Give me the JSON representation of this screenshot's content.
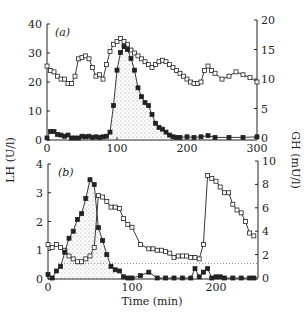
{
  "chart_data": [
    {
      "type": "line",
      "panel_label": "(a)",
      "x_ticks": [
        0,
        100,
        200,
        300
      ],
      "xlim": [
        0,
        300
      ],
      "left_axis": {
        "label": "LH (U/l)",
        "ticks": [
          0,
          10,
          20,
          30,
          40
        ],
        "lim": [
          0,
          40
        ]
      },
      "right_axis": {
        "label": "GH (mU/l)",
        "ticks": [
          0,
          5,
          10,
          15,
          20
        ],
        "lim": [
          0,
          20
        ]
      },
      "series": [
        {
          "name": "LH",
          "marker": "open-square",
          "axis": "left",
          "x": [
            0,
            5,
            10,
            15,
            20,
            25,
            30,
            35,
            40,
            45,
            50,
            55,
            60,
            65,
            70,
            75,
            80,
            85,
            90,
            95,
            100,
            105,
            110,
            115,
            120,
            125,
            130,
            135,
            140,
            145,
            150,
            155,
            160,
            165,
            170,
            175,
            180,
            185,
            190,
            195,
            200,
            205,
            210,
            215,
            220,
            225,
            230,
            235,
            240,
            250,
            260,
            270,
            280,
            290,
            300
          ],
          "y": [
            25.5,
            24,
            23.5,
            22,
            21,
            21,
            19.5,
            19.5,
            22,
            28,
            28.5,
            29,
            28,
            25,
            22,
            22.5,
            21,
            26,
            30.5,
            33,
            34,
            35,
            34,
            33,
            31,
            30,
            29,
            28,
            27,
            26,
            25,
            26,
            27,
            27.5,
            27,
            26,
            25,
            24,
            23,
            22,
            21,
            20,
            19.5,
            19.5,
            20,
            24,
            25.5,
            24,
            23,
            21,
            22,
            23.5,
            22.5,
            21.5,
            20
          ]
        },
        {
          "name": "GH",
          "marker": "filled-square",
          "axis": "right",
          "x": [
            0,
            5,
            10,
            15,
            20,
            25,
            30,
            35,
            40,
            45,
            50,
            55,
            60,
            65,
            70,
            75,
            80,
            85,
            90,
            95,
            100,
            105,
            110,
            115,
            120,
            125,
            130,
            135,
            140,
            145,
            150,
            155,
            160,
            165,
            170,
            175,
            180,
            185,
            190,
            200,
            210,
            220,
            230,
            240,
            260,
            280,
            300
          ],
          "y": [
            0,
            1.1,
            1.1,
            0.6,
            0.5,
            0.3,
            0.5,
            0,
            0,
            0,
            0.3,
            0.2,
            0.3,
            0.1,
            0.2,
            0.1,
            0.2,
            0.3,
            1.0,
            5.5,
            11.5,
            14.5,
            15.5,
            15,
            13.5,
            11.5,
            8.5,
            7,
            6,
            5.5,
            4,
            2.5,
            1.8,
            1.5,
            1,
            0.5,
            0.2,
            0.1,
            0.1,
            0.2,
            0.1,
            0.2,
            0.4,
            0.1,
            0.1,
            0.1,
            0.2
          ]
        }
      ],
      "shaded": "area under GH pulse (~90-190 min)"
    },
    {
      "type": "line",
      "panel_label": "(b)",
      "x_ticks": [
        0,
        100,
        200
      ],
      "xlim": [
        0,
        250
      ],
      "xlabel": "Time (min)",
      "left_axis": {
        "label": "LH (U/l)",
        "ticks": [
          0,
          1,
          2,
          3,
          4
        ],
        "lim": [
          0,
          4
        ]
      },
      "right_axis": {
        "label": "GH (mU/l)",
        "ticks": [
          0,
          2,
          4,
          6,
          8,
          10
        ],
        "lim": [
          0,
          10
        ]
      },
      "series": [
        {
          "name": "LH",
          "marker": "open-square",
          "axis": "left",
          "x": [
            0,
            5,
            10,
            15,
            20,
            25,
            30,
            35,
            40,
            45,
            50,
            55,
            60,
            65,
            70,
            75,
            80,
            85,
            90,
            95,
            100,
            110,
            120,
            125,
            130,
            135,
            140,
            145,
            150,
            155,
            160,
            165,
            170,
            175,
            180,
            185,
            190,
            195,
            200,
            205,
            210,
            215,
            220,
            225,
            230,
            235,
            240,
            245
          ],
          "y": [
            1.2,
            1.1,
            1.2,
            1.1,
            1.0,
            0.8,
            0.7,
            0.6,
            0.6,
            0.7,
            0.8,
            1.1,
            2.9,
            2.85,
            2.7,
            2.5,
            2.5,
            2.45,
            2.1,
            1.9,
            1.8,
            1.2,
            1.05,
            1.05,
            1.0,
            1.0,
            0.95,
            0.9,
            0.75,
            0.8,
            0.8,
            0.8,
            0.75,
            0.75,
            0.7,
            1.2,
            3.6,
            3.5,
            3.4,
            3.2,
            3.0,
            3.0,
            2.6,
            2.4,
            2.3,
            2.0,
            1.6,
            1.5
          ]
        },
        {
          "name": "GH",
          "marker": "filled-square",
          "axis": "right",
          "x": [
            0,
            5,
            10,
            15,
            20,
            25,
            30,
            35,
            40,
            45,
            50,
            55,
            60,
            65,
            70,
            75,
            80,
            85,
            90,
            95,
            100,
            110,
            120,
            130,
            140,
            150,
            160,
            170,
            175,
            180,
            185,
            190,
            195,
            200,
            205,
            210,
            220,
            230,
            240,
            245
          ],
          "y": [
            0.3,
            0,
            0.6,
            1.0,
            2.2,
            3.4,
            4.0,
            5.0,
            5.5,
            6.8,
            8.4,
            8.0,
            4.3,
            3.2,
            2.0,
            1.0,
            0.7,
            0.6,
            0.1,
            0,
            0,
            0.2,
            0.5,
            0,
            0,
            0,
            0,
            0,
            0.8,
            0.1,
            0.5,
            0.8,
            0,
            0.1,
            0.1,
            0,
            0,
            0,
            0,
            0
          ]
        }
      ],
      "reference_line": {
        "axis": "right",
        "value": 1.25,
        "style": "dotted"
      },
      "shaded": "area under LH rise (~15-80 min)"
    }
  ],
  "labels": {
    "panel_a": "(a)",
    "panel_b": "(b)",
    "y_left": "LH (U/l)",
    "y_right": "GH (mU/l)",
    "x_axis": "Time (min)"
  }
}
